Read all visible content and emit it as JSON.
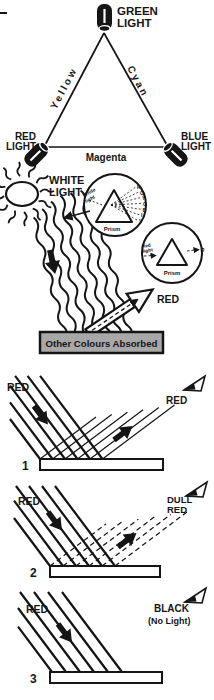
{
  "palette": {
    "ink": "#151515",
    "box_gray": "#a8a8a8",
    "paper": "#ffffff"
  },
  "colour_triangle": {
    "green": {
      "line1": "GREEN",
      "line2": "LIGHT"
    },
    "red": {
      "line1": "RED",
      "line2": "LIGHT"
    },
    "blue": {
      "line1": "BLUE",
      "line2": "LIGHT"
    },
    "edge_left": "Yellow",
    "edge_right": "Cyan",
    "edge_bottom": "Magenta"
  },
  "dispersion": {
    "source": {
      "line1": "WHITE",
      "line2": "LIGHT"
    },
    "white_prism": {
      "input_line1": "White",
      "input_line2": "light",
      "label": "Prism",
      "spectrum": [
        "R",
        "O",
        "Y",
        "G",
        "B",
        "I",
        "V"
      ]
    },
    "red_prism": {
      "input_line1": "Red",
      "input_line2": "light",
      "label": "Prism",
      "output": "R"
    },
    "reflected": "RED",
    "absorbed": "Other Colours Absorbed"
  },
  "diagrams": [
    {
      "number": "1",
      "incident_label": "RED",
      "result_line1": "RED",
      "result_line2": ""
    },
    {
      "number": "2",
      "incident_label": "RED",
      "result_line1": "DULL",
      "result_line2": "RED"
    },
    {
      "number": "3",
      "incident_label": "RED",
      "result_line1": "BLACK",
      "result_line2": "(No Light)"
    }
  ]
}
